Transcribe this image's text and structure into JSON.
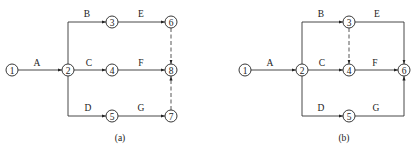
{
  "diagrams": [
    {
      "caption": "(a)",
      "nodes": [
        {
          "id": "1",
          "label": "1",
          "x": 12,
          "y": 70
        },
        {
          "id": "2",
          "label": "2",
          "x": 68,
          "y": 70
        },
        {
          "id": "3",
          "label": "3",
          "x": 112,
          "y": 22
        },
        {
          "id": "4",
          "label": "4",
          "x": 112,
          "y": 70
        },
        {
          "id": "5",
          "label": "5",
          "x": 112,
          "y": 116
        },
        {
          "id": "6",
          "label": "6",
          "x": 171,
          "y": 22
        },
        {
          "id": "8",
          "label": "8",
          "x": 171,
          "y": 70
        },
        {
          "id": "7",
          "label": "7",
          "x": 171,
          "y": 116
        }
      ],
      "activities": [
        {
          "label": "A",
          "from": "1",
          "to": "2",
          "type": "real"
        },
        {
          "label": "B",
          "from": "2",
          "to": "3",
          "type": "real"
        },
        {
          "label": "C",
          "from": "2",
          "to": "4",
          "type": "real"
        },
        {
          "label": "D",
          "from": "2",
          "to": "5",
          "type": "real"
        },
        {
          "label": "E",
          "from": "3",
          "to": "6",
          "type": "real"
        },
        {
          "label": "F",
          "from": "4",
          "to": "8",
          "type": "real"
        },
        {
          "label": "G",
          "from": "5",
          "to": "7",
          "type": "real"
        },
        {
          "label": "",
          "from": "6",
          "to": "8",
          "type": "dummy"
        },
        {
          "label": "",
          "from": "7",
          "to": "8",
          "type": "dummy"
        }
      ]
    },
    {
      "caption": "(b)",
      "nodes": [
        {
          "id": "1",
          "label": "1",
          "x": 245,
          "y": 70
        },
        {
          "id": "2",
          "label": "2",
          "x": 302,
          "y": 70
        },
        {
          "id": "3",
          "label": "3",
          "x": 349,
          "y": 22
        },
        {
          "id": "4",
          "label": "4",
          "x": 349,
          "y": 70
        },
        {
          "id": "5",
          "label": "5",
          "x": 349,
          "y": 116
        },
        {
          "id": "6",
          "label": "6",
          "x": 404,
          "y": 70
        }
      ],
      "activities": [
        {
          "label": "A",
          "from": "1",
          "to": "2",
          "type": "real"
        },
        {
          "label": "B",
          "from": "2",
          "to": "3",
          "type": "real"
        },
        {
          "label": "C",
          "from": "2",
          "to": "4",
          "type": "real"
        },
        {
          "label": "D",
          "from": "2",
          "to": "5",
          "type": "real"
        },
        {
          "label": "E",
          "from": "3",
          "to": "6",
          "type": "real"
        },
        {
          "label": "F",
          "from": "4",
          "to": "6",
          "type": "real"
        },
        {
          "label": "G",
          "from": "5",
          "to": "6",
          "type": "real"
        },
        {
          "label": "",
          "from": "3",
          "to": "4",
          "type": "dummy"
        }
      ]
    }
  ]
}
